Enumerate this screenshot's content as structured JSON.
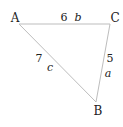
{
  "diagram": {
    "type": "triangle",
    "vertices": [
      {
        "label": "A",
        "x": 19,
        "y": 24
      },
      {
        "label": "C",
        "x": 110,
        "y": 24
      },
      {
        "label": "B",
        "x": 96,
        "y": 102
      }
    ],
    "sides": [
      {
        "name": "b",
        "between": [
          "A",
          "C"
        ],
        "length": "6"
      },
      {
        "name": "c",
        "between": [
          "A",
          "B"
        ],
        "length": "7"
      },
      {
        "name": "a",
        "between": [
          "C",
          "B"
        ],
        "length": "5"
      }
    ],
    "colors": {
      "line": "#bdbdbd",
      "text": "#222222"
    }
  }
}
